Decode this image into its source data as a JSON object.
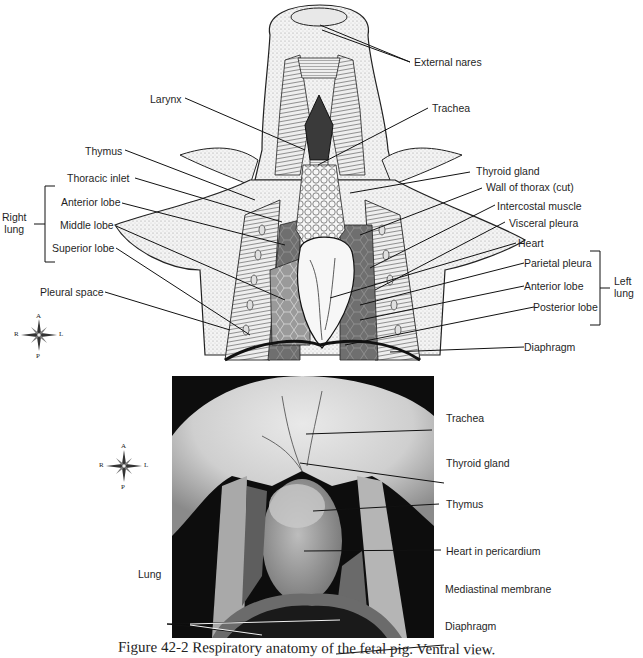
{
  "figure": {
    "caption": "Figure 42-2  Respiratory anatomy of the fetal pig. Ventral view."
  },
  "illustration": {
    "labels_left": {
      "larynx": "Larynx",
      "thymus": "Thymus",
      "thoracic_inlet": "Thoracic inlet",
      "right_lung_group": "Right\nlung",
      "right_lung_line1": "Right",
      "right_lung_line2": "lung",
      "anterior_lobe": "Anterior lobe",
      "middle_lobe": "Middle lobe",
      "superior_lobe": "Superior lobe",
      "pleural_space": "Pleural space"
    },
    "labels_right": {
      "external_nares": "External nares",
      "trachea": "Trachea",
      "thyroid_gland": "Thyroid gland",
      "wall_of_thorax": "Wall of thorax (cut)",
      "intercostal_muscle": "Intercostal muscle",
      "visceral_pleura": "Visceral pleura",
      "heart": "Heart",
      "parietal_pleura": "Parietal pleura",
      "anterior_lobe": "Anterior lobe",
      "posterior_lobe": "Posterior lobe",
      "left_lung_line1": "Left",
      "left_lung_line2": "lung",
      "diaphragm": "Diaphragm"
    },
    "compass": {
      "a": "A",
      "p": "P",
      "r": "R",
      "l": "L"
    }
  },
  "photo": {
    "labels": {
      "trachea": "Trachea",
      "thyroid_gland": "Thyroid gland",
      "thymus": "Thymus",
      "heart_in_pericardium": "Heart in pericardium",
      "lung": "Lung",
      "mediastinal_membrane": "Mediastinal membrane",
      "diaphragm": "Diaphragm"
    },
    "compass": {
      "a": "A",
      "p": "P",
      "r": "R",
      "l": "L"
    }
  }
}
